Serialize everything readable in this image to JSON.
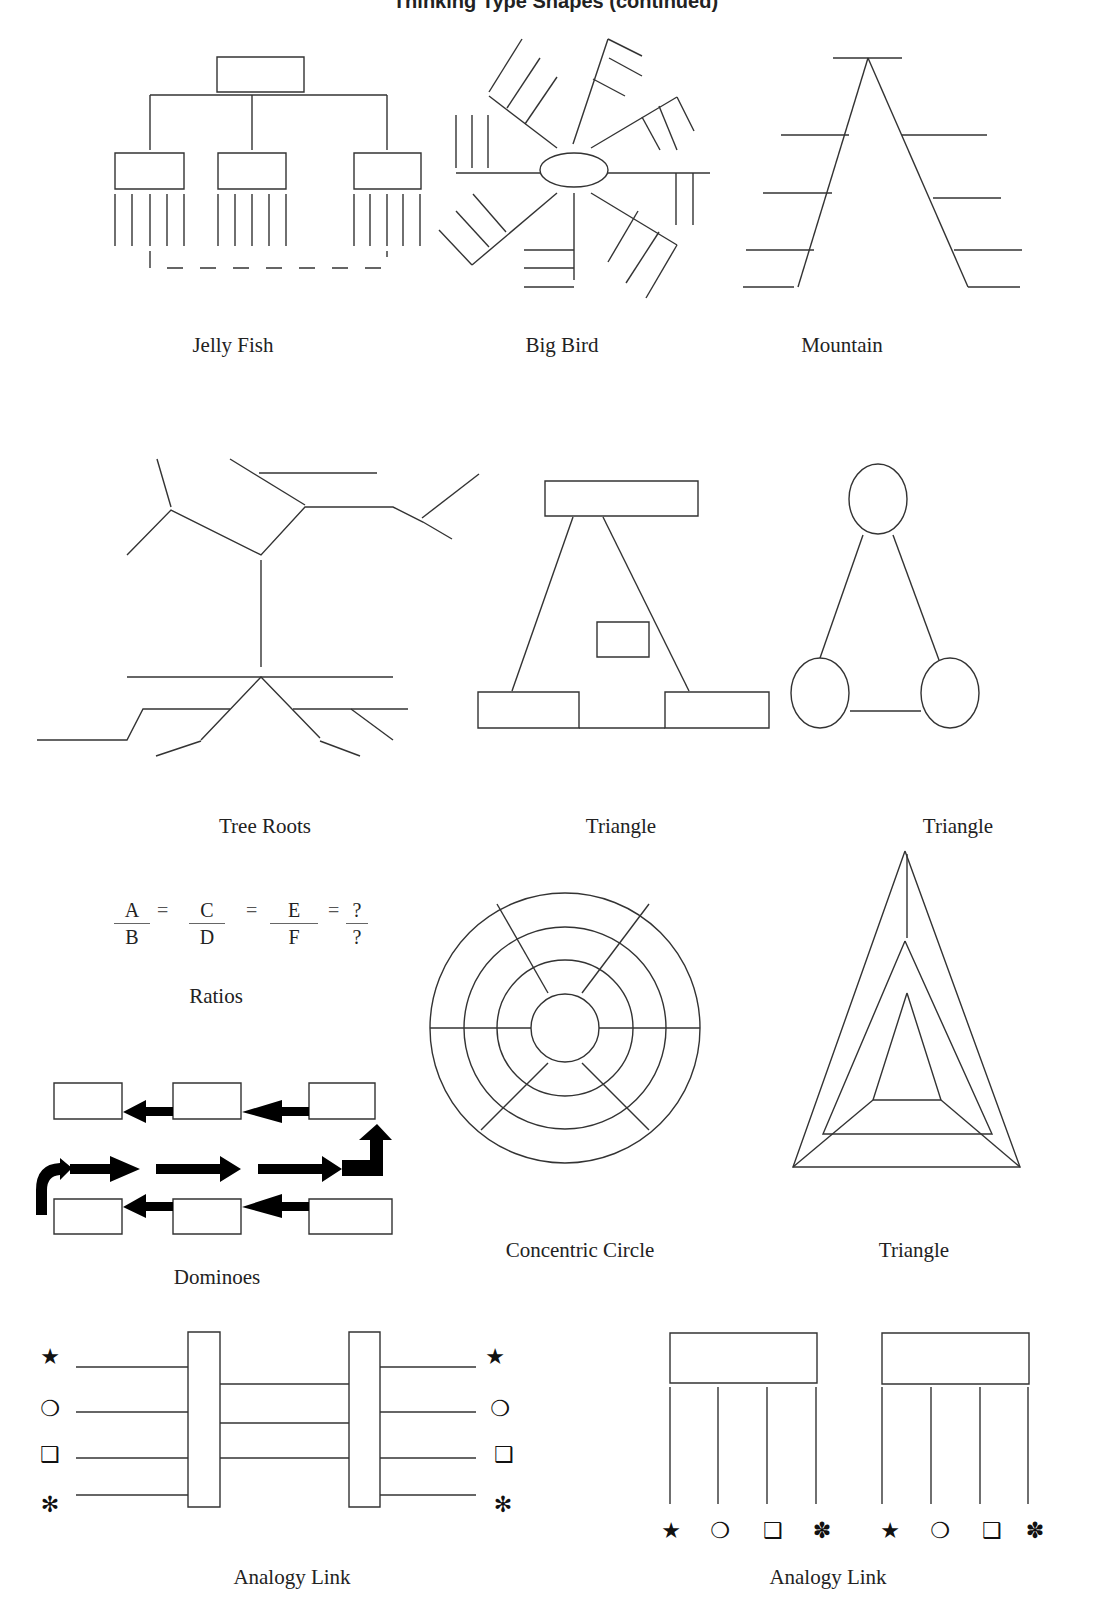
{
  "page": {
    "header": "Thinking Type Shapes (continued)"
  },
  "diagrams": [
    {
      "id": "jelly-fish",
      "label": "Jelly Fish"
    },
    {
      "id": "big-bird",
      "label": "Big Bird"
    },
    {
      "id": "mountain",
      "label": "Mountain"
    },
    {
      "id": "tree-roots",
      "label": "Tree Roots"
    },
    {
      "id": "triangle-boxes",
      "label": "Triangle"
    },
    {
      "id": "triangle-circles",
      "label": "Triangle"
    },
    {
      "id": "ratios",
      "label": "Ratios"
    },
    {
      "id": "concentric-circle",
      "label": "Concentric Circle"
    },
    {
      "id": "nested-triangle",
      "label": "Triangle"
    },
    {
      "id": "dominoes",
      "label": "Dominoes"
    },
    {
      "id": "analogy-link-bars",
      "label": "Analogy Link"
    },
    {
      "id": "analogy-link-boxes",
      "label": "Analogy Link"
    }
  ],
  "ratios": {
    "fractions": [
      {
        "num": "A",
        "den": "B"
      },
      {
        "num": "C",
        "den": "D"
      },
      {
        "num": "E",
        "den": "F"
      },
      {
        "num": "?",
        "den": "?"
      }
    ],
    "equals": "="
  },
  "symbols": {
    "star": "★",
    "circle": "❍",
    "square": "❑",
    "asterisk": "✻",
    "flower": "✽"
  }
}
